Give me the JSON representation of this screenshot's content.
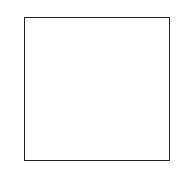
{
  "diagram": {
    "column_labels": [
      "8",
      "7",
      "6",
      "5",
      "4",
      "3",
      "2",
      "1"
    ],
    "row_labels_right": [
      "h",
      "g",
      "f",
      "e",
      "d",
      "c",
      "b",
      "a"
    ],
    "row_counts_left": [
      "8",
      "2",
      "5",
      "3",
      "3",
      "3",
      "3",
      "2"
    ],
    "rows": [
      {
        "label": "h",
        "cells": [
          {
            "h": false
          },
          {
            "h": false,
            "n": "8"
          },
          {
            "h": false
          },
          {
            "h": false
          },
          {
            "h": false
          },
          {
            "h": false
          },
          {
            "h": false
          },
          {
            "h": false
          }
        ]
      },
      {
        "label": "g",
        "cells": [
          {
            "h": true
          },
          {
            "h": true
          },
          {
            "h": true
          },
          {
            "h": false,
            "n": "2"
          },
          {
            "h": false
          },
          {
            "h": true
          },
          {
            "h": true
          },
          {
            "h": true
          }
        ]
      },
      {
        "label": "f",
        "cells": [
          {
            "h": false
          },
          {
            "h": false
          },
          {
            "h": false,
            "n": "7"
          },
          {
            "h": false
          },
          {
            "h": false
          },
          {
            "h": true
          },
          {
            "h": true
          },
          {
            "h": true
          }
        ]
      },
      {
        "label": "e",
        "cells": [
          {
            "h": true
          },
          {
            "h": true
          },
          {
            "h": true
          },
          {
            "h": true
          },
          {
            "h": false
          },
          {
            "h": false
          },
          {
            "h": false,
            "n": "6"
          },
          {
            "h": true
          }
        ]
      },
      {
        "label": "d",
        "cells": [
          {
            "h": true
          },
          {
            "h": true
          },
          {
            "h": true
          },
          {
            "h": true
          },
          {
            "h": false,
            "n": "5"
          },
          {
            "h": false
          },
          {
            "h": false
          },
          {
            "h": true
          }
        ]
      },
      {
        "label": "c",
        "cells": [
          {
            "h": true
          },
          {
            "h": true
          },
          {
            "h": true
          },
          {
            "h": true
          },
          {
            "h": false
          },
          {
            "h": false,
            "n": "4"
          },
          {
            "h": false
          },
          {
            "h": true
          }
        ]
      },
      {
        "label": "b",
        "cells": [
          {
            "h": false
          },
          {
            "h": true
          },
          {
            "h": true
          },
          {
            "h": true
          },
          {
            "h": true
          },
          {
            "h": true
          },
          {
            "h": false
          },
          {
            "h": false
          }
        ]
      },
      {
        "label": "a",
        "cells": [
          {
            "h": true
          },
          {
            "h": true
          },
          {
            "h": true
          },
          {
            "h": true
          },
          {
            "h": true
          },
          {
            "h": true
          },
          {
            "h": false
          },
          {
            "h": false,
            "n": "1"
          }
        ]
      }
    ]
  }
}
